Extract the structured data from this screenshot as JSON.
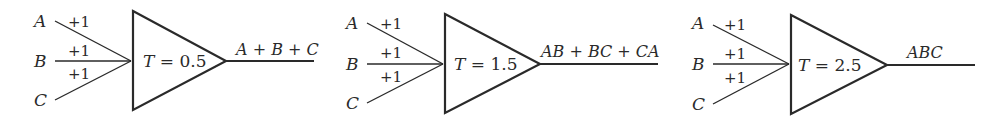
{
  "neurons": [
    {
      "inputs": [
        {
          "label": "A",
          "weight": "+1"
        },
        {
          "label": "B",
          "weight": "+1"
        },
        {
          "label": "C",
          "weight": "+1"
        }
      ],
      "threshold_label": "T",
      "threshold_value": "0.5",
      "threshold_text": "T = 0.5",
      "output": "A + B + C"
    },
    {
      "inputs": [
        {
          "label": "A",
          "weight": "+1"
        },
        {
          "label": "B",
          "weight": "+1"
        },
        {
          "label": "C",
          "weight": "+1"
        }
      ],
      "threshold_label": "T",
      "threshold_value": "1.5",
      "threshold_text": "T = 1.5",
      "output": "AB + BC + CA"
    },
    {
      "inputs": [
        {
          "label": "A",
          "weight": "+1"
        },
        {
          "label": "B",
          "weight": "+1"
        },
        {
          "label": "C",
          "weight": "+1"
        }
      ],
      "threshold_label": "T",
      "threshold_value": "2.5",
      "threshold_text": "T = 2.5",
      "output": "ABC"
    }
  ],
  "colors": {
    "stroke": "#2a2a2a",
    "background": "#ffffff"
  }
}
